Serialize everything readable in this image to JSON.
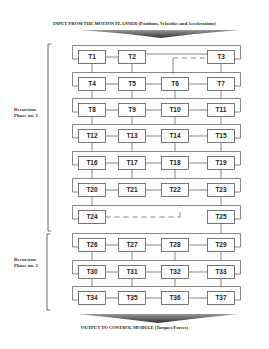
{
  "header": {
    "input_label": "INPUT FROM THE MOTION PLANNER (Positions, Velocities and Accelerations)"
  },
  "footer": {
    "output_label": "OUTPUT TO CONTROL MODULE (Torques/Forces)"
  },
  "phases": [
    {
      "label_line1": "Recursion",
      "label_line2": "Phase no. 1"
    },
    {
      "label_line1": "Recursion",
      "label_line2": "Phase no. 2"
    }
  ],
  "tasks": {
    "T1": "T1",
    "T2": "T2",
    "T3": "T3",
    "T4": "T4",
    "T5": "T5",
    "T6": "T6",
    "T7": "T7",
    "T8": "T8",
    "T9": "T9",
    "T10": "T10",
    "T11": "T11",
    "T12": "T12",
    "T13": "T13",
    "T14": "T14",
    "T15": "T15",
    "T16": "T16",
    "T17": "T17",
    "T18": "T18",
    "T19": "T19",
    "T20": "T20",
    "T21": "T21",
    "T22": "T22",
    "T23": "T23",
    "T24": "T24",
    "T25": "T25",
    "T26": "T26",
    "T27": "T27",
    "T28": "T28",
    "T29": "T29",
    "T30": "T30",
    "T31": "T31",
    "T32": "T32",
    "T33": "T33",
    "T34": "T34",
    "T35": "T35",
    "T36": "T36",
    "T37": "T37"
  },
  "colors": {
    "line": "#555555",
    "arrow": "#444444"
  }
}
